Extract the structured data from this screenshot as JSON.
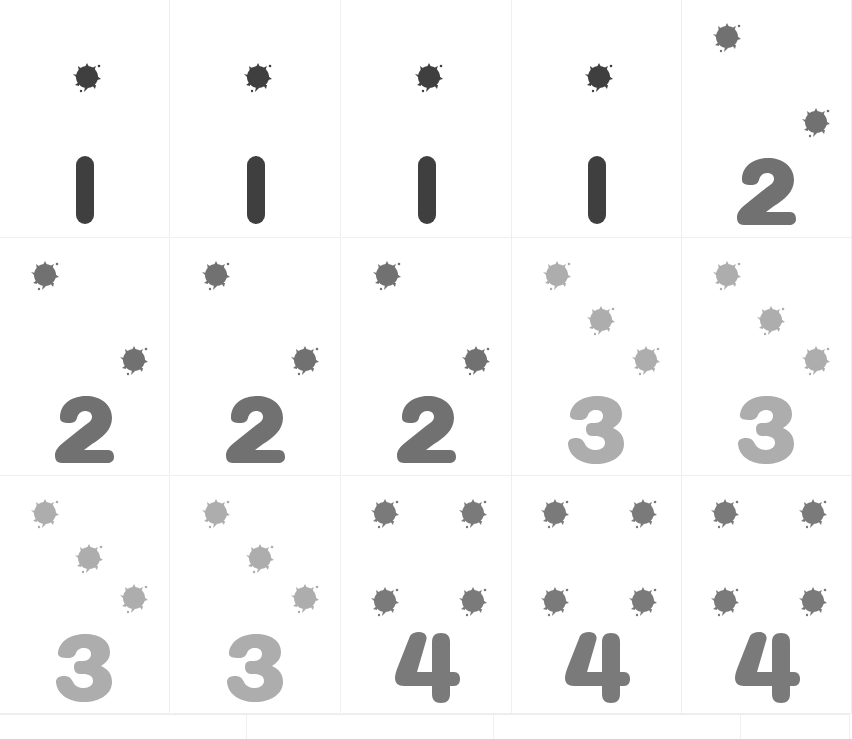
{
  "sheet": {
    "title": "Counting cards 1-4",
    "columns": 5,
    "rows": 3
  },
  "colors": {
    "one": "#3f3f3f",
    "two": "#717171",
    "three": "#adadad",
    "four": "#7a7a7a"
  },
  "cards": [
    {
      "numeral": "1",
      "dots": 1
    },
    {
      "numeral": "1",
      "dots": 1
    },
    {
      "numeral": "1",
      "dots": 1
    },
    {
      "numeral": "1",
      "dots": 1
    },
    {
      "numeral": "2",
      "dots": 2
    },
    {
      "numeral": "2",
      "dots": 2
    },
    {
      "numeral": "2",
      "dots": 2
    },
    {
      "numeral": "2",
      "dots": 2
    },
    {
      "numeral": "3",
      "dots": 3
    },
    {
      "numeral": "3",
      "dots": 3
    },
    {
      "numeral": "3",
      "dots": 3
    },
    {
      "numeral": "3",
      "dots": 3
    },
    {
      "numeral": "4",
      "dots": 4
    },
    {
      "numeral": "4",
      "dots": 4
    },
    {
      "numeral": "4",
      "dots": 4
    }
  ]
}
